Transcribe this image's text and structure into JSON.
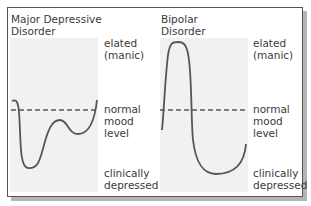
{
  "panels": [
    {
      "title_line1": "Major Depressive",
      "title_line2": "Disorder",
      "labels": {
        "elated_1": "elated",
        "elated_2": "(manic)",
        "normal_1": "normal",
        "normal_2": "mood",
        "normal_3": "level",
        "depressed_1": "clinically",
        "depressed_2": "depressed"
      }
    },
    {
      "title_line1": "Bipolar",
      "title_line2": "Disorder",
      "labels": {
        "elated_1": "elated",
        "elated_2": "(manic)",
        "normal_1": "normal",
        "normal_2": "mood",
        "normal_3": "level",
        "depressed_1": "clinically",
        "depressed_2": "depressed"
      }
    }
  ],
  "colors": {
    "curve": "#555555",
    "plot_background": "#f1f1f1",
    "shadow": "#b5b5b5",
    "border": "#555555"
  }
}
